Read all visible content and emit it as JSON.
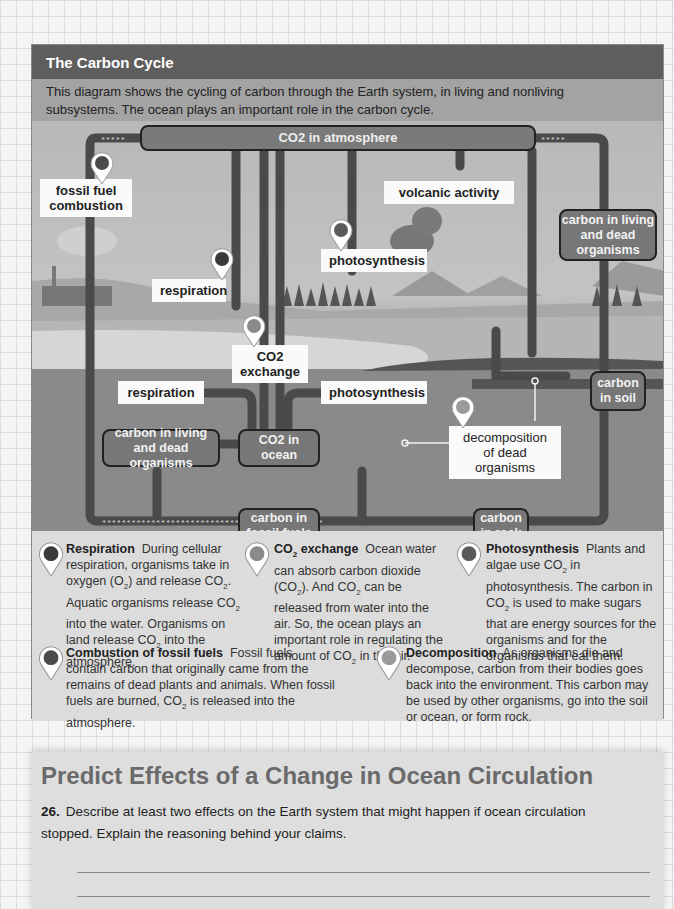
{
  "panel": {
    "title": "The Carbon Cycle",
    "intro": "This diagram shows the cycling of carbon through the Earth system, in living and nonliving subsystems. The ocean plays an important role in the carbon cycle.",
    "intro_line1": "This diagram shows the cycling of carbon through the Earth system, in living and nonliving",
    "intro_line2": "subsystems. The ocean plays an important role in the carbon cycle."
  },
  "diagram": {
    "reservoirs": {
      "atmosphere": "CO2 in atmosphere",
      "land_organisms": "carbon in living and dead organisms",
      "soil": "carbon in soil",
      "ocean_organisms": "carbon in living and dead organisms",
      "ocean_co2": "CO2 in ocean",
      "fossil_fuels": "carbon in fossil fuels",
      "rock": "carbon in rock"
    },
    "processes": {
      "fossil_fuel_combustion": "fossil fuel combustion",
      "volcanic_activity": "volcanic activity",
      "land_respiration": "respiration",
      "land_photosynthesis": "photosynthesis",
      "co2_exchange": "CO2 exchange",
      "ocean_respiration": "respiration",
      "ocean_photosynthesis": "photosynthesis",
      "decomposition": "decomposition of dead organisms"
    },
    "pin_colors": {
      "respiration": "#3a3a3a",
      "co2_exchange": "#8a8a8a",
      "photosynthesis": "#5a5a5a",
      "combustion": "#4a4a4a",
      "decomposition": "#9a9a9a"
    }
  },
  "legend": [
    {
      "title": "Respiration",
      "text": "During cellular respiration, organisms take in oxygen (O2) and release CO2. Aquatic organisms release CO2 into the water. Organisms on land release CO2 into the atmosphere."
    },
    {
      "title": "CO2 exchange",
      "text": "Ocean water can absorb carbon dioxide (CO2). And CO2 can be released from water into the air. So, the ocean plays an important role in regulating the amount of CO2 in the air."
    },
    {
      "title": "Photosynthesis",
      "text": "Plants and algae use CO2 in photosynthesis. The carbon in CO2 is used to make sugars that are energy sources for the organisms and for the organisms that eat them."
    },
    {
      "title": "Combustion of fossil fuels",
      "text": "Fossil fuels contain carbon that originally came from the remains of dead plants and animals. When fossil fuels are burned, CO2 is released into the atmosphere."
    },
    {
      "title": "Decomposition",
      "text": "As organisms die and decompose, carbon from their bodies goes back into the environment. This carbon may be used by other organisms, go into the soil or ocean, or form rock."
    }
  ],
  "section": {
    "heading": "Predict Effects of a Change in Ocean Circulation",
    "question_number": "26.",
    "question_text": "Describe at least two effects on the Earth system that might happen if ocean circulation stopped. Explain the reasoning behind your claims.",
    "answer_lines": 3
  }
}
